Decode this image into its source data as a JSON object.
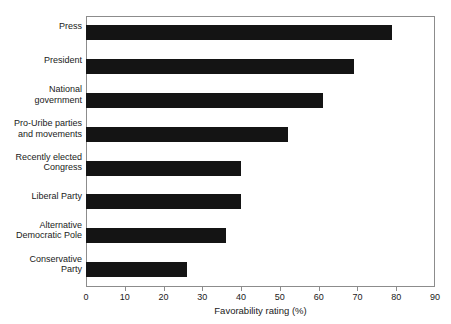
{
  "figure": {
    "caption_remnant": "",
    "background_color": "#ffffff",
    "bar_color": "#141414",
    "axis_color": "#8c8c8c"
  },
  "chart_data": {
    "type": "bar",
    "orientation": "horizontal",
    "title": "",
    "xlabel": "Favorability rating (%)",
    "ylabel": "",
    "xlim": [
      0,
      90
    ],
    "xticks": [
      0,
      10,
      20,
      30,
      40,
      50,
      60,
      70,
      80,
      90
    ],
    "xtick_labels": [
      "0",
      "10",
      "20",
      "30",
      "40",
      "50",
      "60",
      "70",
      "80",
      "90"
    ],
    "grid": false,
    "legend": null,
    "categories": [
      "Press",
      "President",
      "National government",
      "Pro-Uribe parties and movements",
      "Recently elected Congress",
      "Liberal Party",
      "Alternative Democratic Pole",
      "Conservative Party"
    ],
    "category_label_lines": [
      [
        "Press"
      ],
      [
        "President"
      ],
      [
        "National",
        "government"
      ],
      [
        "Pro-Uribe parties",
        "and movements"
      ],
      [
        "Recently elected",
        "Congress"
      ],
      [
        "Liberal Party"
      ],
      [
        "Alternative",
        "Democratic Pole"
      ],
      [
        "Conservative",
        "Party"
      ]
    ],
    "values": [
      79,
      69,
      61,
      52,
      40,
      40,
      36,
      26
    ],
    "series": [
      {
        "name": "Favorability rating (%)",
        "values": [
          79,
          69,
          61,
          52,
          40,
          40,
          36,
          26
        ]
      }
    ]
  }
}
